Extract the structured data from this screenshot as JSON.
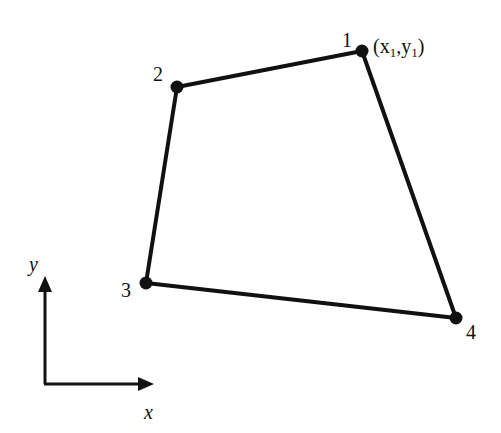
{
  "diagram": {
    "nodes": [
      {
        "id": "1",
        "label": "1",
        "x": 362,
        "y": 51,
        "coord_label": "(x1,y1)"
      },
      {
        "id": "2",
        "label": "2",
        "x": 177,
        "y": 87
      },
      {
        "id": "3",
        "label": "3",
        "x": 146,
        "y": 283
      },
      {
        "id": "4",
        "label": "4",
        "x": 456,
        "y": 318
      }
    ],
    "edges": [
      [
        "1",
        "2"
      ],
      [
        "2",
        "3"
      ],
      [
        "3",
        "4"
      ],
      [
        "4",
        "1"
      ]
    ],
    "coord_label": {
      "open": "(x",
      "sub1": "1",
      "mid": ",y",
      "sub2": "1",
      "close": ")"
    },
    "axes": {
      "x_label": "x",
      "y_label": "y"
    },
    "colors": {
      "line": "#111111",
      "background": "#ffffff"
    }
  }
}
